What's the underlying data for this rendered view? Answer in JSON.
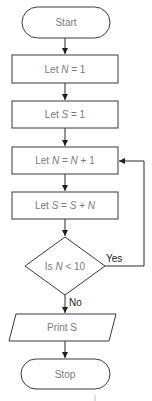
{
  "flowchart": {
    "nodes": [
      {
        "id": "start",
        "type": "terminal",
        "label": "Start"
      },
      {
        "id": "init-n",
        "type": "process",
        "label_prefix": "Let ",
        "var": "N",
        "label_suffix": " = 1"
      },
      {
        "id": "init-s",
        "type": "process",
        "label_prefix": "Let ",
        "var": "S",
        "label_suffix": " = 1"
      },
      {
        "id": "inc-n",
        "type": "process",
        "label_prefix": "Let ",
        "var": "N",
        "mid": " = ",
        "var2": "N",
        "label_suffix": " + 1"
      },
      {
        "id": "add-s",
        "type": "process",
        "label_prefix": "Let ",
        "var": "S",
        "mid": " = ",
        "var2": "S",
        "mid2": " + ",
        "var3": "N"
      },
      {
        "id": "check",
        "type": "decision",
        "label_prefix": "Is ",
        "var": "N",
        "label_suffix": " < 10"
      },
      {
        "id": "print",
        "type": "io",
        "label": "Print S"
      },
      {
        "id": "stop",
        "type": "terminal",
        "label": "Stop"
      }
    ],
    "edges": [
      {
        "from": "start",
        "to": "init-n",
        "label": ""
      },
      {
        "from": "init-n",
        "to": "init-s",
        "label": ""
      },
      {
        "from": "init-s",
        "to": "inc-n",
        "label": ""
      },
      {
        "from": "inc-n",
        "to": "add-s",
        "label": ""
      },
      {
        "from": "add-s",
        "to": "check",
        "label": ""
      },
      {
        "from": "check",
        "to": "inc-n",
        "label": "Yes"
      },
      {
        "from": "check",
        "to": "print",
        "label": "No"
      },
      {
        "from": "print",
        "to": "stop",
        "label": ""
      }
    ]
  },
  "colors": {
    "stroke": "#3a3a3a",
    "text": "#7a7a7a",
    "edge_label": "#222222"
  }
}
